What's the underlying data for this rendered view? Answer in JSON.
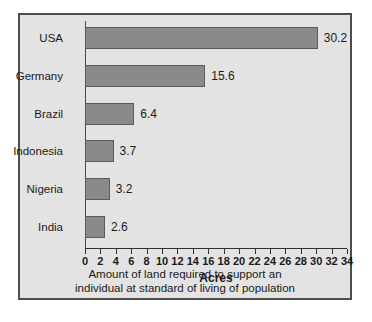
{
  "chart_data": {
    "type": "bar",
    "orientation": "horizontal",
    "title": "",
    "categories": [
      "USA",
      "Germany",
      "Brazil",
      "Indonesia",
      "Nigeria",
      "India"
    ],
    "values": [
      30.2,
      15.6,
      6.4,
      3.7,
      3.2,
      2.6
    ],
    "value_labels": [
      "30.2",
      "15.6",
      "6.4",
      "3.7",
      "3.2",
      "2.6"
    ],
    "xlabel": "Acres",
    "ylabel": "",
    "xlim": [
      0,
      34
    ],
    "xticks": [
      0,
      2,
      4,
      6,
      8,
      10,
      12,
      14,
      16,
      18,
      20,
      22,
      24,
      26,
      28,
      30,
      32,
      34
    ],
    "xtick_labels": [
      "0",
      "2",
      "4",
      "6",
      "8",
      "10",
      "12",
      "14",
      "16",
      "18",
      "20",
      "22",
      "24",
      "26",
      "28",
      "30",
      "32",
      "34"
    ],
    "grid": false,
    "legend": null,
    "caption_line1": "Amount of land required to support an",
    "caption_line2": "individual at standard of living of population",
    "colors": {
      "bar_fill": "#8a8a8a",
      "bar_stroke": "#5a5a5a",
      "panel_background": "#e3e3e3",
      "panel_border": "#4d4d4d",
      "axis": "#2e2e2e",
      "text": "#1a1a1a"
    }
  }
}
